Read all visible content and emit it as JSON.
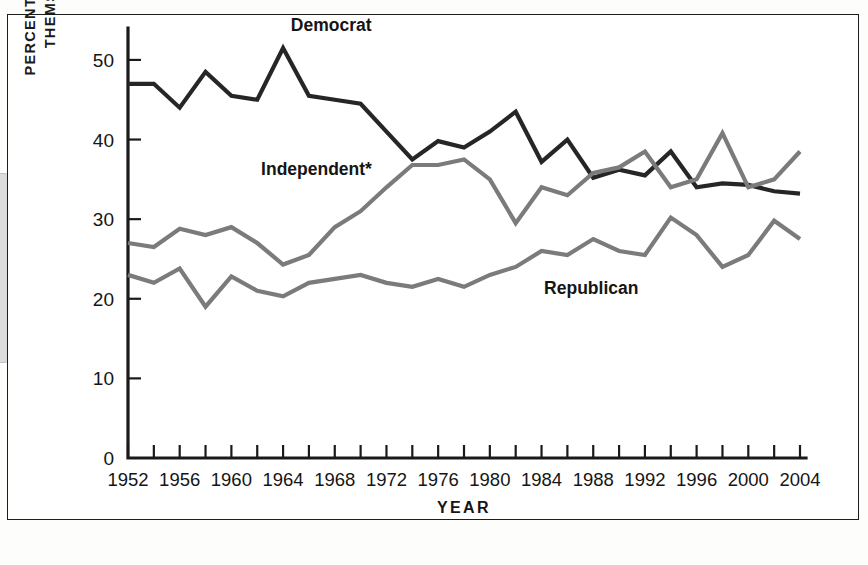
{
  "figure": {
    "frame_color": "#1d1d1d",
    "background": "#ffffff"
  },
  "chart_data": {
    "type": "line",
    "title": "",
    "xlabel": "YEAR",
    "ylabel_line1": "PERCENTAGE IDENTIFYING",
    "ylabel_line2": "THEMSELVES AS . . .",
    "xlim": [
      1952,
      2004
    ],
    "ylim": [
      0,
      52
    ],
    "yticks": [
      0,
      10,
      20,
      30,
      40,
      50
    ],
    "ytick_labels": [
      "0",
      "10",
      "20",
      "30",
      "40",
      "50"
    ],
    "xticks": [
      1952,
      1954,
      1956,
      1958,
      1960,
      1962,
      1964,
      1966,
      1968,
      1970,
      1972,
      1974,
      1976,
      1978,
      1980,
      1982,
      1984,
      1986,
      1988,
      1990,
      1992,
      1994,
      1996,
      1998,
      2000,
      2002,
      2004
    ],
    "xtick_labels_shown": [
      "1952",
      "1956",
      "1960",
      "1964",
      "1968",
      "1972",
      "1976",
      "1980",
      "1984",
      "1988",
      "1992",
      "1996",
      "2000",
      "2004"
    ],
    "grid": false,
    "legend_position": "inline-annotations",
    "x": [
      1952,
      1954,
      1956,
      1958,
      1960,
      1962,
      1964,
      1966,
      1968,
      1970,
      1972,
      1974,
      1976,
      1978,
      1980,
      1982,
      1984,
      1986,
      1988,
      1990,
      1992,
      1994,
      1996,
      1998,
      2000,
      2002,
      2004
    ],
    "series": [
      {
        "name": "Democrat",
        "color": "#262626",
        "label": "Democrat",
        "label_x": 1964.6,
        "label_y": 53.6,
        "values": [
          47.0,
          47.0,
          44.0,
          48.5,
          45.5,
          45.0,
          51.5,
          45.5,
          45.0,
          44.5,
          41.0,
          37.5,
          39.8,
          39.0,
          41.0,
          43.5,
          37.2,
          40.0,
          35.2,
          36.2,
          35.5,
          38.5,
          34.0,
          34.5,
          34.3,
          33.5,
          33.2
        ]
      },
      {
        "name": "Independent",
        "color": "#7b7b7b",
        "label": "Independent*",
        "label_x": 1962.3,
        "label_y": 35.6,
        "values": [
          27.0,
          26.5,
          28.8,
          28.0,
          29.0,
          27.0,
          24.3,
          25.5,
          29.0,
          31.0,
          34.0,
          36.8,
          36.8,
          37.5,
          35.0,
          29.5,
          34.0,
          33.0,
          35.8,
          36.5,
          38.5,
          34.0,
          35.0,
          40.8,
          34.0,
          35.0,
          38.5
        ]
      },
      {
        "name": "Republican",
        "color": "#7b7b7b",
        "label": "Republican",
        "label_x": 1984.2,
        "label_y": 20.6,
        "values": [
          23.0,
          22.0,
          23.8,
          19.0,
          22.8,
          21.0,
          20.3,
          22.0,
          22.5,
          23.0,
          22.0,
          21.5,
          22.5,
          21.5,
          23.0,
          24.0,
          26.0,
          25.5,
          27.5,
          26.0,
          25.5,
          30.2,
          28.0,
          24.0,
          25.5,
          29.8,
          27.5
        ]
      }
    ]
  },
  "footnote_marker": "*"
}
